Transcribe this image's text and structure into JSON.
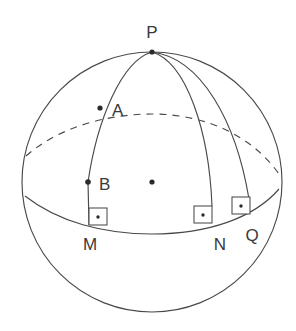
{
  "figure": {
    "stroke_color": "#4a4a4a",
    "dot_color": "#2b2b2b",
    "background_color": "#ffffff",
    "labels": {
      "pole": "P",
      "point_a": "A",
      "point_b": "B",
      "foot_m": "M",
      "foot_n": "N",
      "foot_q": "Q"
    },
    "label_positions": {
      "pole": {
        "x": 152,
        "y": 38
      },
      "point_a": {
        "x": 113,
        "y": 116
      },
      "point_b": {
        "x": 101,
        "y": 190
      },
      "foot_m": {
        "x": 90,
        "y": 249
      },
      "foot_n": {
        "x": 219,
        "y": 249
      },
      "foot_q": {
        "x": 251,
        "y": 241
      }
    },
    "geometry": {
      "sphere_center": {
        "x": 152,
        "y": 182
      },
      "sphere_radius": 130,
      "pole_point": {
        "x": 152,
        "y": 52
      },
      "center_dot": {
        "x": 152,
        "y": 182
      },
      "dots": [
        {
          "name": "P",
          "x": 152,
          "y": 52
        },
        {
          "name": "A",
          "x": 100,
          "y": 108
        },
        {
          "name": "B",
          "x": 88,
          "y": 182
        },
        {
          "name": "center",
          "x": 152,
          "y": 182
        }
      ],
      "meridian_pm": "M 152 52 C 120 60, 97 120, 88 182 L 89 224",
      "meridian_pn": "M 152 52 C 186 62, 209 130, 212 205",
      "meridian_pq": "M 152 52 C 200 58, 235 120, 248 198",
      "latitude_dashed": "M 26 156 C 60 126, 110 114, 152 114 C 206 114, 252 136, 279 174",
      "latitude_solid": "M 25 196 C 58 222, 104 234, 152 234 C 208 234, 254 218, 279 189",
      "right_angle_boxes": [
        {
          "name": "M",
          "x": 89,
          "y": 208,
          "w": 18,
          "h": 17,
          "dot_x": 98,
          "dot_y": 217
        },
        {
          "name": "N",
          "x": 194,
          "y": 206,
          "w": 18,
          "h": 17,
          "dot_x": 203,
          "dot_y": 215
        },
        {
          "name": "Q",
          "x": 232,
          "y": 197,
          "w": 18,
          "h": 17,
          "dot_x": 241,
          "dot_y": 206
        }
      ]
    }
  }
}
